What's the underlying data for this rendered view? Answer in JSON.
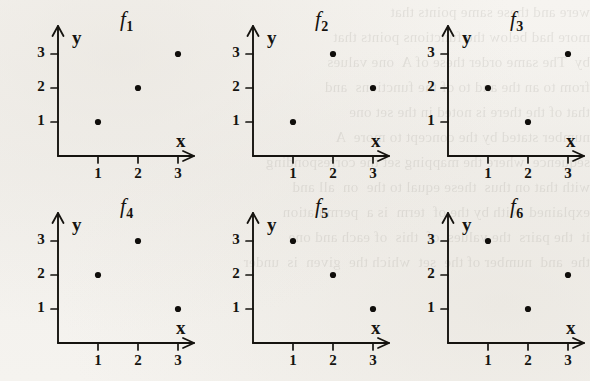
{
  "page": {
    "background_color": "#f4f2ee",
    "ink_color": "#15130f",
    "ghost_text": "were and these same points that\nmore had below the functions points that\nby  The same order these of A  one values\nfrom to an the and to of the functions  and\nthat of the there is noted in the set one\nnumber stated by the concept to more  A\nsequence  where the mapping set the corresponding\nwith that on thus  these equal to the  on  all and\nexplained  with by the of  term  is a  permutation\nit  the pairs  the values  of  this  of each and one\nthe  and  number of the  set  which the  given  is  under"
  },
  "chart_data": [
    {
      "type": "scatter",
      "title": "f",
      "subscript": "1",
      "xlabel": "x",
      "ylabel": "y",
      "x": [
        1,
        2,
        3
      ],
      "values": [
        1,
        2,
        3
      ],
      "xticks": [
        1,
        2,
        3
      ],
      "yticks": [
        1,
        2,
        3
      ],
      "xlim": [
        0,
        3.6
      ],
      "ylim": [
        0,
        3.6
      ],
      "grid": false,
      "legend": "none"
    },
    {
      "type": "scatter",
      "title": "f",
      "subscript": "2",
      "xlabel": "x",
      "ylabel": "y",
      "x": [
        1,
        2,
        3
      ],
      "values": [
        1,
        3,
        2
      ],
      "xticks": [
        1,
        2,
        3
      ],
      "yticks": [
        1,
        2,
        3
      ],
      "xlim": [
        0,
        3.6
      ],
      "ylim": [
        0,
        3.6
      ],
      "grid": false,
      "legend": "none"
    },
    {
      "type": "scatter",
      "title": "f",
      "subscript": "3",
      "xlabel": "x",
      "ylabel": "y",
      "x": [
        1,
        2,
        3
      ],
      "values": [
        2,
        1,
        3
      ],
      "xticks": [
        1,
        2,
        3
      ],
      "yticks": [
        1,
        2,
        3
      ],
      "xlim": [
        0,
        3.6
      ],
      "ylim": [
        0,
        3.6
      ],
      "grid": false,
      "legend": "none"
    },
    {
      "type": "scatter",
      "title": "f",
      "subscript": "4",
      "xlabel": "x",
      "ylabel": "y",
      "x": [
        1,
        2,
        3
      ],
      "values": [
        2,
        3,
        1
      ],
      "xticks": [
        1,
        2,
        3
      ],
      "yticks": [
        1,
        2,
        3
      ],
      "xlim": [
        0,
        3.6
      ],
      "ylim": [
        0,
        3.6
      ],
      "grid": false,
      "legend": "none"
    },
    {
      "type": "scatter",
      "title": "f",
      "subscript": "5",
      "xlabel": "x",
      "ylabel": "y",
      "x": [
        1,
        2,
        3
      ],
      "values": [
        3,
        2,
        1
      ],
      "xticks": [
        1,
        2,
        3
      ],
      "yticks": [
        1,
        2,
        3
      ],
      "xlim": [
        0,
        3.6
      ],
      "ylim": [
        0,
        3.6
      ],
      "grid": false,
      "legend": "none"
    },
    {
      "type": "scatter",
      "title": "f",
      "subscript": "6",
      "xlabel": "x",
      "ylabel": "y",
      "x": [
        1,
        2,
        3
      ],
      "values": [
        3,
        1,
        2
      ],
      "xticks": [
        1,
        2,
        3
      ],
      "yticks": [
        1,
        2,
        3
      ],
      "xlim": [
        0,
        3.6
      ],
      "ylim": [
        0,
        3.6
      ],
      "grid": false,
      "legend": "none"
    }
  ]
}
